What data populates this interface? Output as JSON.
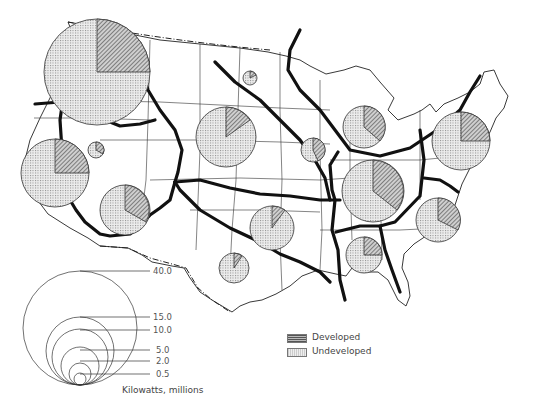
{
  "map": {
    "title": "Hydroelectric power capacity by region, United States",
    "legend": {
      "developed_label": "Developed",
      "undeveloped_label": "Undeveloped",
      "developed_pattern": "diagonal-hatch",
      "undeveloped_pattern": "fine-dot-stipple"
    },
    "scale": {
      "unit_label": "Kilowatts, millions",
      "values": [
        "40.0",
        "15.0",
        "10.0",
        "5.0",
        "2.0",
        "0.5"
      ]
    },
    "colors": {
      "background": "#ffffff",
      "ink": "#111111",
      "stipple": "#d9d9d9",
      "hatch": "#555555"
    },
    "regions": [
      {
        "name": "Pacific Northwest",
        "cx": 97,
        "cy": 72,
        "r": 53,
        "developed_fraction": 0.24
      },
      {
        "name": "Northern Nevada small",
        "cx": 96,
        "cy": 150,
        "r": 8,
        "developed_fraction": 0.35
      },
      {
        "name": "California",
        "cx": 55,
        "cy": 173,
        "r": 34,
        "developed_fraction": 0.25
      },
      {
        "name": "Colorado River",
        "cx": 125,
        "cy": 210,
        "r": 25,
        "developed_fraction": 0.3
      },
      {
        "name": "Upper Missouri",
        "cx": 226,
        "cy": 137,
        "r": 30,
        "developed_fraction": 0.18
      },
      {
        "name": "Red River north",
        "cx": 250,
        "cy": 78,
        "r": 7,
        "developed_fraction": 0.2
      },
      {
        "name": "Arkansas-White-Red",
        "cx": 272,
        "cy": 228,
        "r": 22,
        "developed_fraction": 0.1
      },
      {
        "name": "Western Gulf",
        "cx": 234,
        "cy": 268,
        "r": 15,
        "developed_fraction": 0.08
      },
      {
        "name": "Upper Mississippi",
        "cx": 313,
        "cy": 150,
        "r": 12,
        "developed_fraction": 0.3
      },
      {
        "name": "Great Lakes",
        "cx": 364,
        "cy": 127,
        "r": 21,
        "developed_fraction": 0.35
      },
      {
        "name": "Ohio",
        "cx": 373,
        "cy": 191,
        "r": 31,
        "developed_fraction": 0.3
      },
      {
        "name": "North Atlantic",
        "cx": 461,
        "cy": 141,
        "r": 29,
        "developed_fraction": 0.25
      },
      {
        "name": "South Atlantic",
        "cx": 438,
        "cy": 220,
        "r": 22,
        "developed_fraction": 0.3
      },
      {
        "name": "Southeast",
        "cx": 364,
        "cy": 255,
        "r": 18,
        "developed_fraction": 0.25
      }
    ]
  }
}
